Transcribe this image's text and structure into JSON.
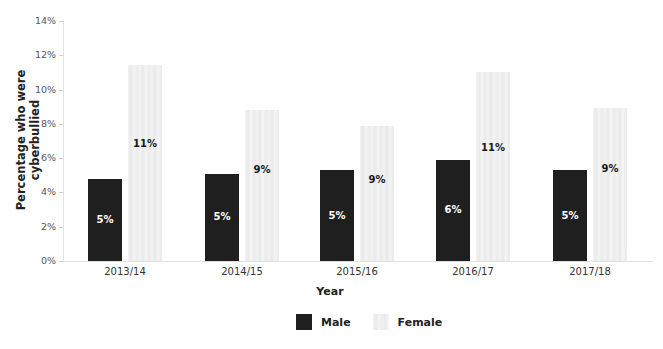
{
  "chart_data": {
    "type": "bar",
    "title": "",
    "xlabel": "Year",
    "ylabel": "Percentage who were cyberbullied",
    "categories": [
      "2013/14",
      "2014/15",
      "2015/16",
      "2016/17",
      "2017/18"
    ],
    "series": [
      {
        "name": "Male",
        "color": "#1f1f1f",
        "values": [
          4.8,
          5.1,
          5.3,
          5.9,
          5.3
        ],
        "labels": [
          "5%",
          "5%",
          "5%",
          "6%",
          "5%"
        ]
      },
      {
        "name": "Female",
        "color": "#ececec",
        "values": [
          11.4,
          8.8,
          7.9,
          11.0,
          8.9
        ],
        "labels": [
          "11%",
          "9%",
          "9%",
          "11%",
          "9%"
        ]
      }
    ],
    "ylim": [
      0,
      14
    ],
    "yticks": [
      "0%",
      "2%",
      "4%",
      "6%",
      "8%",
      "10%",
      "12%",
      "14%"
    ],
    "grid": false,
    "legend_position": "bottom"
  },
  "legend": {
    "male": "Male",
    "female": "Female"
  }
}
